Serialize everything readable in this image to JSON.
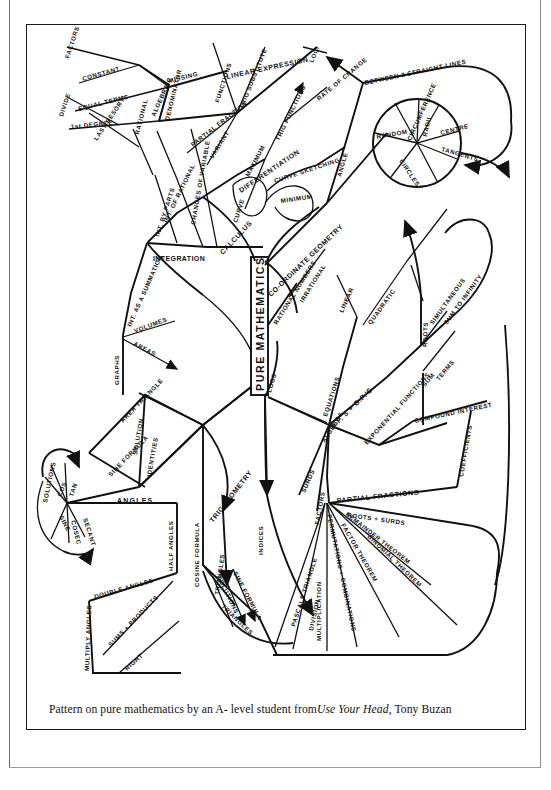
{
  "document": {
    "type": "scanned-book-figure",
    "caption": {
      "lead": "Pattern on pure mathematics by an  A- level student from ",
      "title_italic": "Use Your Head",
      "tail": ", Tony Buzan"
    }
  },
  "colors": {
    "ink": "#111111",
    "paper": "#ffffff",
    "frame": "#1a1a1a",
    "page_edge": "#6b6b6b"
  },
  "mindmap": {
    "center_label": "PURE MATHEMATICS",
    "branches": [
      {
        "name": "calculus",
        "label": "CALCULUS",
        "children": [
          {
            "label": "INTEGRATION",
            "children": [
              {
                "label": "INT. BY PARTS"
              },
              {
                "label": "LAST RESORT!"
              },
              {
                "label": "DIVIDE"
              },
              {
                "label": "INT. OF RATIONAL"
              },
              {
                "label": "RATIONAL ALGEBRAIC"
              },
              {
                "label": "CHANGES OF VARIABLE"
              },
              {
                "label": "INT. AS A SUMMATION"
              },
              {
                "label": "GRAPHS"
              },
              {
                "label": "VOLUMES"
              },
              {
                "label": "AREAS"
              },
              {
                "label": "PARTIAL FRACTIONS"
              },
              {
                "label": "DENOMINATOR"
              },
              {
                "label": "EQUAL TERMS"
              },
              {
                "label": "FACTORS"
              },
              {
                "label": "CONSTANT"
              },
              {
                "label": "MISSING"
              },
              {
                "label": "LINEAR EXPRESSION"
              },
              {
                "label": "1st DEGREE"
              },
              {
                "label": "FUNCTIONS"
              },
              {
                "label": "TRIG SUBSTITUTE"
              }
            ]
          },
          {
            "label": "DIFFERENTIATION",
            "children": [
              {
                "label": "TRIG FUNCTIONS"
              },
              {
                "label": "RATE OF CHANGE"
              },
              {
                "label": "INTEGRATION"
              },
              {
                "label": "CURVE SKETCHING"
              },
              {
                "label": "MAXIMUM"
              },
              {
                "label": "MINIMUM"
              }
            ]
          }
        ]
      },
      {
        "name": "coordinate-geometry",
        "label": "CO-ORDINATE GEOMETRY",
        "children": [
          {
            "label": "ANGLE BETWEEN 2 STRAIGHT LINES"
          },
          {
            "label": "LOCI"
          },
          {
            "label": "CIRCLES",
            "children": [
              {
                "label": "CENTRE"
              },
              {
                "label": "RADII"
              },
              {
                "label": "CIRCUMFERENCE"
              },
              {
                "label": "TANGENTS"
              }
            ]
          }
        ]
      },
      {
        "name": "numbers",
        "label": "RATIONAL NUMBERS",
        "children": [
          {
            "label": "IRRATIONAL NUMBERS"
          },
          {
            "label": "LOGS"
          },
          {
            "label": "INDICES"
          }
        ]
      },
      {
        "name": "algebra",
        "label": "ALGEBRA",
        "children": [
          {
            "label": "EQUATIONS",
            "children": [
              {
                "label": "LINEAR"
              },
              {
                "label": "QUADRATIC"
              },
              {
                "label": "ROOTS"
              },
              {
                "label": "SIMULTANEOUS"
              }
            ]
          },
          {
            "label": "A.P.'S + G.P.'S",
            "children": [
              {
                "label": "SUM"
              },
              {
                "label": "TERMS"
              },
              {
                "label": "SUM TO INFINITY"
              }
            ]
          },
          {
            "label": "EXPONENTIAL FUNCTIONS",
            "children": [
              {
                "label": "COMPOUND INTEREST"
              }
            ]
          },
          {
            "label": "PARTIAL FRACTIONS",
            "children": [
              {
                "label": "COEFFICIENTS"
              },
              {
                "label": "ROOTS + SURDS"
              },
              {
                "label": "REMAINDER THEOREM"
              },
              {
                "label": "FACTOR THEOREM"
              },
              {
                "label": "BINOMIAL THEOREM"
              },
              {
                "label": "PERMUTATIONS + COMBINATIONS"
              },
              {
                "label": "MULTIPLICATION"
              },
              {
                "label": "DIVISION"
              },
              {
                "label": "PASCALS TRIANGLE"
              }
            ]
          },
          {
            "label": "SURDS"
          },
          {
            "label": "FACTORS"
          }
        ]
      },
      {
        "name": "trigonometry",
        "label": "TRIGONOMETRY",
        "children": [
          {
            "label": "IDENTITIES"
          },
          {
            "label": "SOLUTION"
          },
          {
            "label": "AREA TRIANGLE"
          },
          {
            "label": "SINE FORMULA"
          },
          {
            "label": "COSINE FORMULA"
          },
          {
            "label": "SOLUTIONS"
          },
          {
            "label": "TRIANGLES"
          },
          {
            "label": "RIGHT"
          },
          {
            "label": "ANGLES",
            "children": [
              {
                "label": "SOLUTIONS"
              },
              {
                "label": "COS"
              },
              {
                "label": "TAN"
              },
              {
                "label": "SINE"
              },
              {
                "label": "COSEC"
              },
              {
                "label": "SECANT"
              }
            ]
          },
          {
            "label": "HALF ANGLES"
          },
          {
            "label": "DOUBLE ANGLES"
          },
          {
            "label": "MULTIPLY ANGLES"
          },
          {
            "label": "SUMS + PRODUCTS"
          }
        ]
      }
    ]
  }
}
